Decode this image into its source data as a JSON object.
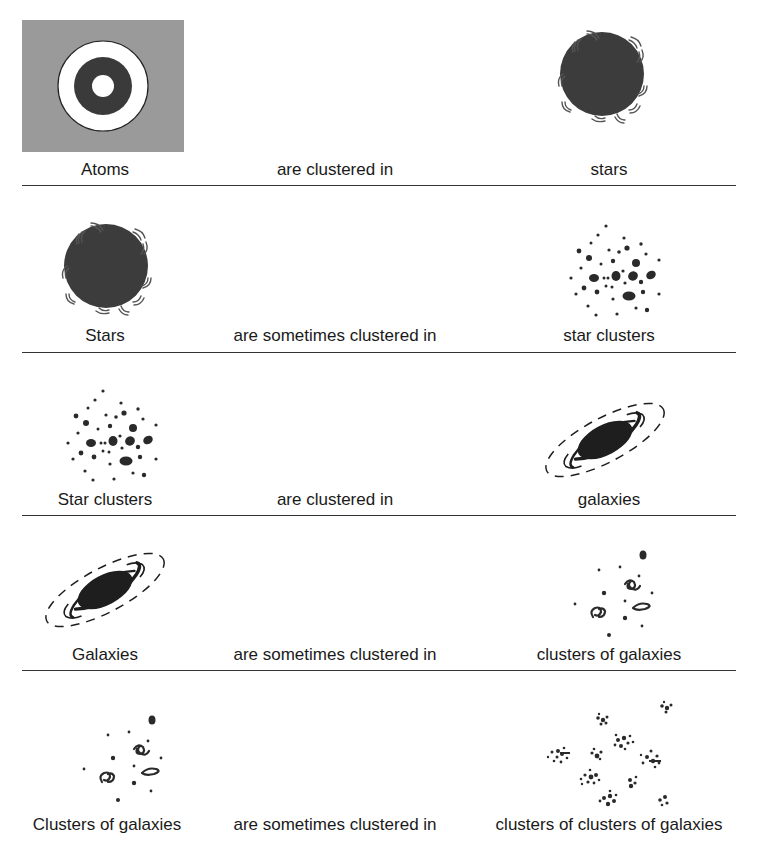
{
  "diagram": {
    "title": "",
    "rows": [
      {
        "subject": "Atoms",
        "relation": "are clustered in",
        "object": "stars",
        "subject_icon": "atom-icon",
        "object_icon": "star-icon"
      },
      {
        "subject": "Stars",
        "relation": "are sometimes clustered in",
        "object": "star clusters",
        "subject_icon": "star-icon",
        "object_icon": "star-cluster-icon"
      },
      {
        "subject": "Star clusters",
        "relation": "are clustered in",
        "object": "galaxies",
        "subject_icon": "star-cluster-icon",
        "object_icon": "galaxy-icon"
      },
      {
        "subject": "Galaxies",
        "relation": "are sometimes clustered in",
        "object": "clusters of galaxies",
        "subject_icon": "galaxy-icon",
        "object_icon": "galaxy-cluster-icon"
      },
      {
        "subject": "Clusters of galaxies",
        "relation": "are sometimes clustered in",
        "object": "clusters of clusters of galaxies",
        "subject_icon": "galaxy-cluster-icon",
        "object_icon": "supercluster-icon"
      }
    ],
    "colors": {
      "atom_background": "#9a9a9a",
      "atom_nucleus_ring": "#3a3a3a",
      "star_fill": "#3c3c3c",
      "ink": "#1a1a1a",
      "divider": "#333333"
    }
  }
}
